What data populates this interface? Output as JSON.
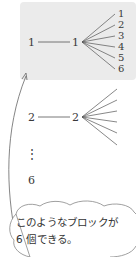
{
  "tree": {
    "first_block": {
      "root": "1",
      "second": "1",
      "leaves": [
        "1",
        "2",
        "3",
        "4",
        "5",
        "6"
      ]
    },
    "second_block": {
      "root": "2",
      "second": "2"
    },
    "ellipsis": "⋮",
    "last_root": "6"
  },
  "callout": {
    "line1": "このようなブロックが",
    "line2": "6 個できる。"
  },
  "colors": {
    "block_background": "#ebebeb",
    "line": "#555555",
    "callout_outline": "#888888"
  }
}
